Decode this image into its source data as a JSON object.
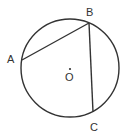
{
  "diagram": {
    "type": "circle-with-chords",
    "stroke_color": "#333333",
    "background": "#ffffff",
    "circle": {
      "center": "O",
      "cx": 70,
      "cy": 68,
      "r": 49
    },
    "points": [
      {
        "name": "A",
        "x": 22,
        "y": 60,
        "label": "A",
        "label_x": 7,
        "label_y": 63
      },
      {
        "name": "B",
        "x": 89,
        "y": 23,
        "label": "B",
        "label_x": 87,
        "label_y": 16
      },
      {
        "name": "C",
        "x": 93,
        "y": 112,
        "label": "C",
        "label_x": 91,
        "label_y": 131
      }
    ],
    "center_point": {
      "name": "O",
      "x": 70,
      "y": 68,
      "label": "O",
      "label_x": 65,
      "label_y": 81
    },
    "segments": [
      {
        "from": "A",
        "to": "B"
      },
      {
        "from": "B",
        "to": "C"
      }
    ]
  }
}
